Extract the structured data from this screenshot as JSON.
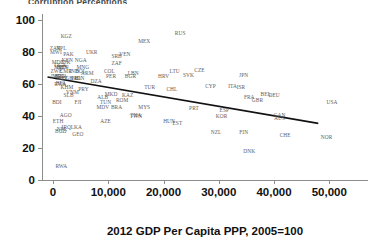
{
  "top_clipped_text": "Corruption Perceptions",
  "chart_data": {
    "type": "scatter",
    "title": "",
    "xlabel": "2012 GDP Per Capita PPP, 2005=100",
    "ylabel": "",
    "xlim": [
      -2000,
      57000
    ],
    "ylim": [
      0,
      104
    ],
    "grid": false,
    "legend": "none",
    "xticks": [
      0,
      10000,
      20000,
      30000,
      40000,
      50000
    ],
    "xticklabels": [
      "0",
      "10,000",
      "20,000",
      "30,000",
      "40,000",
      "50,000"
    ],
    "yticks": [
      0,
      20,
      40,
      60,
      80,
      100
    ],
    "yticklabels": [
      "0",
      "20",
      "40",
      "60",
      "80",
      "100"
    ],
    "trendline": {
      "x": [
        -1000,
        48000
      ],
      "y": [
        64.5,
        35.5
      ],
      "color": "#111111"
    },
    "point_label_color": "#5d5d5d",
    "points": [
      {
        "label": "KGZ",
        "x": 2400,
        "y": 90
      },
      {
        "label": "RUS",
        "x": 23000,
        "y": 92
      },
      {
        "label": "MEX",
        "x": 16500,
        "y": 87
      },
      {
        "label": "ZAR",
        "x": 400,
        "y": 83
      },
      {
        "label": "NPL",
        "x": 1500,
        "y": 83
      },
      {
        "label": "MWI",
        "x": 500,
        "y": 80
      },
      {
        "label": "PAK",
        "x": 2800,
        "y": 79
      },
      {
        "label": "UKR",
        "x": 7000,
        "y": 80
      },
      {
        "label": "VEN",
        "x": 13000,
        "y": 79
      },
      {
        "label": "SRB",
        "x": 11500,
        "y": 78
      },
      {
        "label": "MDG",
        "x": 900,
        "y": 74
      },
      {
        "label": "TJK",
        "x": 2300,
        "y": 74
      },
      {
        "label": "KEN",
        "x": 2600,
        "y": 75
      },
      {
        "label": "NGA",
        "x": 5000,
        "y": 75
      },
      {
        "label": "ZAF",
        "x": 11500,
        "y": 73
      },
      {
        "label": "UGA",
        "x": 1300,
        "y": 72
      },
      {
        "label": "BEN",
        "x": 1600,
        "y": 71
      },
      {
        "label": "MLI",
        "x": 1100,
        "y": 71
      },
      {
        "label": "SEN",
        "x": 1900,
        "y": 71
      },
      {
        "label": "MNG",
        "x": 5400,
        "y": 71
      },
      {
        "label": "ZWE",
        "x": 600,
        "y": 68
      },
      {
        "label": "CMR",
        "x": 2300,
        "y": 68
      },
      {
        "label": "IND",
        "x": 3800,
        "y": 68
      },
      {
        "label": "BOL",
        "x": 5000,
        "y": 68
      },
      {
        "label": "ARM",
        "x": 6200,
        "y": 67
      },
      {
        "label": "COL",
        "x": 10200,
        "y": 68
      },
      {
        "label": "LBN",
        "x": 14500,
        "y": 67
      },
      {
        "label": "LBR",
        "x": 600,
        "y": 65
      },
      {
        "label": "MOZ",
        "x": 1000,
        "y": 65
      },
      {
        "label": "TZA",
        "x": 1600,
        "y": 65
      },
      {
        "label": "SLE",
        "x": 1300,
        "y": 64
      },
      {
        "label": "CIV",
        "x": 1800,
        "y": 64
      },
      {
        "label": "GHA",
        "x": 3300,
        "y": 64
      },
      {
        "label": "PHL",
        "x": 4200,
        "y": 64
      },
      {
        "label": "IDN",
        "x": 4800,
        "y": 64
      },
      {
        "label": "PER",
        "x": 10500,
        "y": 65
      },
      {
        "label": "BGR",
        "x": 14000,
        "y": 65
      },
      {
        "label": "HRV",
        "x": 20000,
        "y": 65
      },
      {
        "label": "LTU",
        "x": 22000,
        "y": 68
      },
      {
        "label": "SVK",
        "x": 24500,
        "y": 66
      },
      {
        "label": "CZE",
        "x": 26500,
        "y": 69
      },
      {
        "label": "JPN",
        "x": 34500,
        "y": 66
      },
      {
        "label": "DZA",
        "x": 7800,
        "y": 62
      },
      {
        "label": "BFA",
        "x": 1400,
        "y": 61
      },
      {
        "label": "RWA2",
        "x": 1300,
        "y": 60
      },
      {
        "label": "KHM",
        "x": 2500,
        "y": 58
      },
      {
        "label": "PRY",
        "x": 5500,
        "y": 57
      },
      {
        "label": "TUR",
        "x": 17500,
        "y": 58
      },
      {
        "label": "CHL",
        "x": 21500,
        "y": 57
      },
      {
        "label": "CYP",
        "x": 28500,
        "y": 59
      },
      {
        "label": "ITA",
        "x": 32500,
        "y": 59
      },
      {
        "label": "ISR",
        "x": 34000,
        "y": 58
      },
      {
        "label": "VNM",
        "x": 3500,
        "y": 55
      },
      {
        "label": "SLB",
        "x": 2800,
        "y": 53
      },
      {
        "label": "MKD",
        "x": 10500,
        "y": 54
      },
      {
        "label": "ALB",
        "x": 9000,
        "y": 52
      },
      {
        "label": "KAZ",
        "x": 13500,
        "y": 53
      },
      {
        "label": "FRA",
        "x": 35500,
        "y": 52
      },
      {
        "label": "BEL",
        "x": 38500,
        "y": 54
      },
      {
        "label": "DEU",
        "x": 40000,
        "y": 53
      },
      {
        "label": "GBR",
        "x": 37000,
        "y": 50
      },
      {
        "label": "BDI",
        "x": 700,
        "y": 49
      },
      {
        "label": "FJI",
        "x": 4500,
        "y": 49
      },
      {
        "label": "TUN",
        "x": 9500,
        "y": 49
      },
      {
        "label": "ROM",
        "x": 12500,
        "y": 50
      },
      {
        "label": "MDV",
        "x": 9000,
        "y": 46
      },
      {
        "label": "BRA",
        "x": 11500,
        "y": 46
      },
      {
        "label": "MYS",
        "x": 16500,
        "y": 46
      },
      {
        "label": "PRT",
        "x": 25500,
        "y": 45
      },
      {
        "label": "ESP",
        "x": 31000,
        "y": 44
      },
      {
        "label": "USA",
        "x": 50500,
        "y": 49
      },
      {
        "label": "AGO",
        "x": 2300,
        "y": 41
      },
      {
        "label": "THA",
        "x": 15000,
        "y": 41
      },
      {
        "label": "TWN",
        "x": 15000,
        "y": 40
      },
      {
        "label": "KOR",
        "x": 30500,
        "y": 40
      },
      {
        "label": "CAN",
        "x": 41000,
        "y": 41
      },
      {
        "label": "AUS",
        "x": 41000,
        "y": 39
      },
      {
        "label": "ETH",
        "x": 900,
        "y": 37
      },
      {
        "label": "AZE",
        "x": 9500,
        "y": 37
      },
      {
        "label": "HUN",
        "x": 21000,
        "y": 37
      },
      {
        "label": "EST",
        "x": 22500,
        "y": 36
      },
      {
        "label": "IRQ",
        "x": 2400,
        "y": 33
      },
      {
        "label": "NPL2",
        "x": 1600,
        "y": 32
      },
      {
        "label": "LKA",
        "x": 4200,
        "y": 33
      },
      {
        "label": "BGD",
        "x": 1400,
        "y": 31
      },
      {
        "label": "GEO",
        "x": 4500,
        "y": 29
      },
      {
        "label": "NZL",
        "x": 29500,
        "y": 30
      },
      {
        "label": "FIN",
        "x": 34500,
        "y": 30
      },
      {
        "label": "CHE",
        "x": 42000,
        "y": 28
      },
      {
        "label": "NOR",
        "x": 49500,
        "y": 27
      },
      {
        "label": "DNK",
        "x": 35500,
        "y": 18
      },
      {
        "label": "RWA",
        "x": 1500,
        "y": 9
      }
    ]
  }
}
